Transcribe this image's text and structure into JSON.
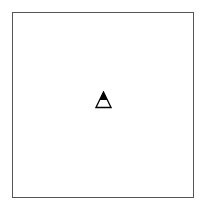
{
  "canvas": {
    "background": "#ffffff",
    "border_color": "#555555"
  },
  "marker": {
    "icon": "warning-triangle-icon",
    "fill_top": "#000000",
    "fill_bottom": "#ffffff",
    "stroke": "#000000"
  }
}
